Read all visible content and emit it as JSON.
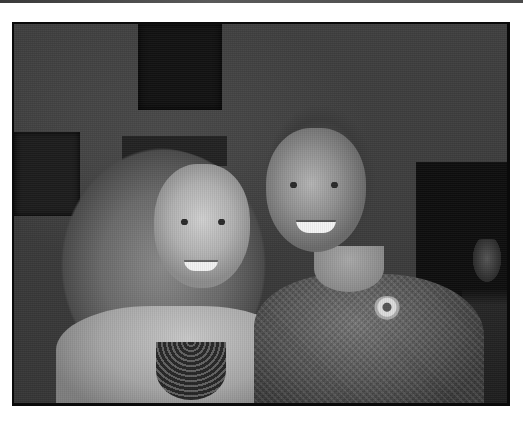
{
  "image": {
    "type": "photograph",
    "color_mode": "grayscale",
    "description": "Two smiling women posing together indoors; woman on left with long wavy hair and beaded statement necklace, woman on right in tweed dress with floral brooch",
    "frame": {
      "border_color": "#0a0a0a",
      "background": "#ffffff"
    },
    "subjects": [
      {
        "position": "left",
        "features": [
          "long wavy hair",
          "beaded statement necklace",
          "light top"
        ]
      },
      {
        "position": "right",
        "features": [
          "shoulder-length hair",
          "tweed dress",
          "floral brooch"
        ]
      }
    ],
    "background_elements": [
      "dark framed paintings",
      "doorway",
      "blurred people"
    ]
  }
}
